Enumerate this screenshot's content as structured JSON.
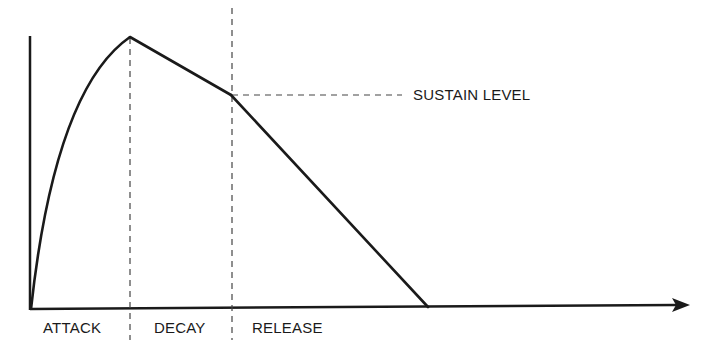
{
  "diagram": {
    "labels": {
      "sustain_level": "SUSTAIN LEVEL",
      "attack": "ATTACK",
      "decay": "DECAY",
      "release": "RELEASE"
    },
    "colors": {
      "line": "#1a1a1a",
      "dashed": "#444444",
      "background": "#ffffff"
    },
    "points": {
      "origin": [
        31,
        309
      ],
      "peak": [
        130,
        37
      ],
      "sustain": [
        231,
        95
      ],
      "release_end": [
        428,
        307
      ]
    },
    "axes": {
      "y_axis_top": [
        29,
        36
      ],
      "x_axis_end": [
        688,
        305
      ]
    },
    "phases": [
      "ATTACK",
      "DECAY",
      "RELEASE"
    ]
  }
}
